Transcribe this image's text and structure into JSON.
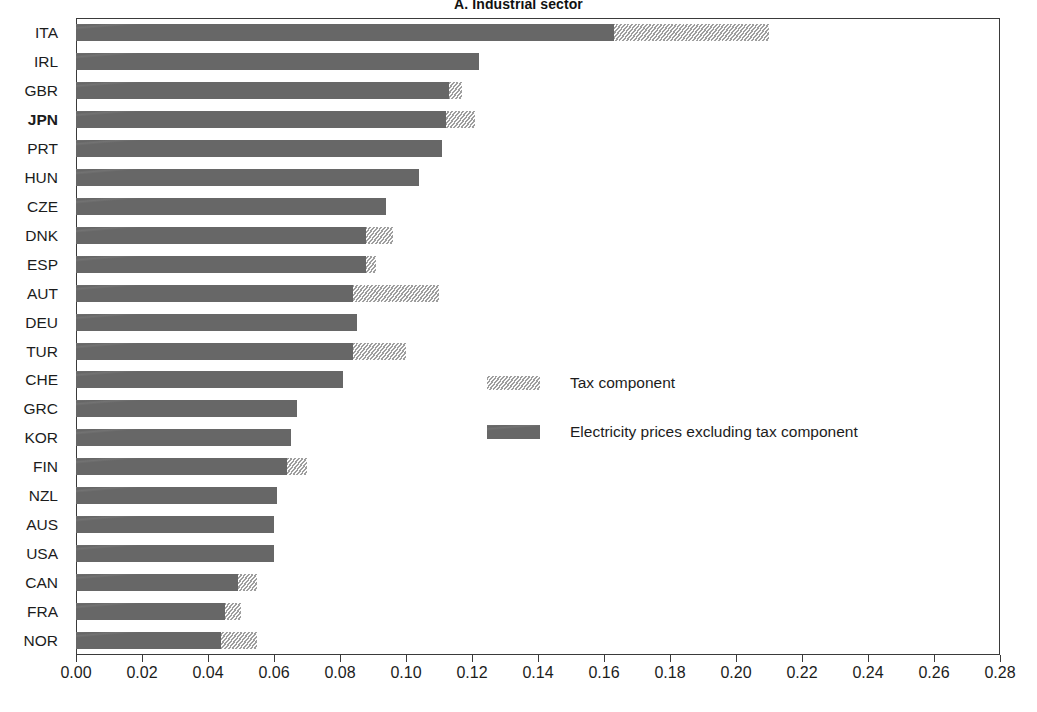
{
  "chart_data": {
    "type": "bar",
    "orientation": "horizontal",
    "stacked": true,
    "title": "A. Industrial sector",
    "xlabel": "",
    "ylabel": "",
    "xlim": [
      0.0,
      0.28
    ],
    "xtick_step": 0.02,
    "xticks": [
      "0.00",
      "0.02",
      "0.04",
      "0.06",
      "0.08",
      "0.10",
      "0.12",
      "0.14",
      "0.16",
      "0.18",
      "0.20",
      "0.22",
      "0.24",
      "0.26",
      "0.28"
    ],
    "grid": false,
    "legend_position": "center-right",
    "categories": [
      "ITA",
      "IRL",
      "GBR",
      "JPN",
      "PRT",
      "HUN",
      "CZE",
      "DNK",
      "ESP",
      "AUT",
      "DEU",
      "TUR",
      "CHE",
      "GRC",
      "KOR",
      "FIN",
      "NZL",
      "AUS",
      "USA",
      "CAN",
      "FRA",
      "NOR"
    ],
    "highlighted_category": "JPN",
    "series": [
      {
        "name": "Electricity prices excluding tax component",
        "color": "#6b6b6b",
        "values": [
          0.163,
          0.122,
          0.113,
          0.112,
          0.111,
          0.104,
          0.094,
          0.088,
          0.088,
          0.084,
          0.085,
          0.084,
          0.081,
          0.067,
          0.065,
          0.064,
          0.061,
          0.06,
          0.06,
          0.049,
          0.045,
          0.044
        ]
      },
      {
        "name": "Tax component",
        "color": "#c9c9c9",
        "values": [
          0.047,
          0.0,
          0.004,
          0.009,
          0.0,
          0.0,
          0.0,
          0.008,
          0.003,
          0.026,
          0.0,
          0.016,
          0.0,
          0.0,
          0.0,
          0.006,
          0.0,
          0.0,
          0.0,
          0.006,
          0.005,
          0.011
        ]
      }
    ],
    "totals": [
      0.21,
      0.122,
      0.117,
      0.121,
      0.111,
      0.104,
      0.094,
      0.096,
      0.091,
      0.11,
      0.085,
      0.1,
      0.081,
      0.067,
      0.065,
      0.07,
      0.061,
      0.06,
      0.06,
      0.055,
      0.05,
      0.055
    ]
  },
  "legend": {
    "items": [
      {
        "label": "Tax component",
        "color": "#c9c9c9"
      },
      {
        "label": "Electricity prices excluding tax component",
        "color": "#6b6b6b"
      }
    ]
  }
}
